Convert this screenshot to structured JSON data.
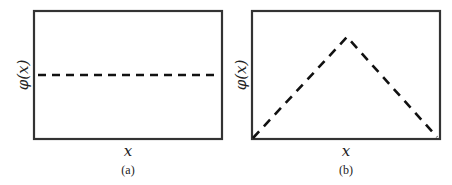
{
  "figure": {
    "panels": [
      {
        "id": "a",
        "caption": "(a)",
        "xlabel": "x",
        "ylabel": "φ(x)",
        "curve": "constant",
        "description": "horizontal dashed line at mid-height"
      },
      {
        "id": "b",
        "caption": "(b)",
        "xlabel": "x",
        "ylabel": "φ(x)",
        "curve": "triangle",
        "description": "dashed tent function rising from bottom-left to peak then falling to bottom-right"
      }
    ],
    "colors": {
      "frame": "#333333",
      "curve": "#111111",
      "background": "#ffffff"
    }
  }
}
